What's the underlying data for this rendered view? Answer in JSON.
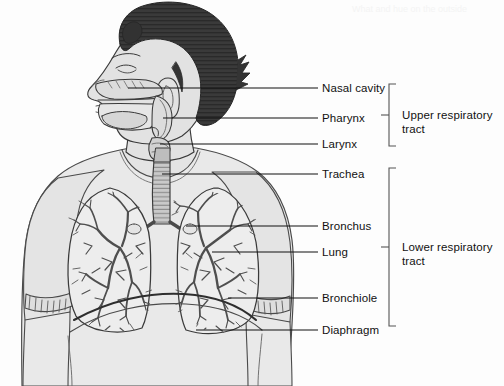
{
  "figure": {
    "background_color": "#fdfdfd",
    "line_color": "#1a1a1a",
    "hair_color": "#3a3a3a",
    "skin_fill": "#e2e2e2",
    "organ_fill": "#ededed",
    "bronchial_tree_color": "#4d4d4d"
  },
  "labels": [
    {
      "id": "nasal-cavity",
      "text": "Nasal cavity",
      "group": "upper"
    },
    {
      "id": "pharynx",
      "text": "Pharynx",
      "group": "upper"
    },
    {
      "id": "larynx",
      "text": "Larynx",
      "group": "upper"
    },
    {
      "id": "trachea",
      "text": "Trachea",
      "group": "lower"
    },
    {
      "id": "bronchus",
      "text": "Bronchus",
      "group": "lower"
    },
    {
      "id": "lung",
      "text": "Lung",
      "group": "lower"
    },
    {
      "id": "bronchiole",
      "text": "Bronchiole",
      "group": "lower"
    },
    {
      "id": "diaphragm",
      "text": "Diaphragm",
      "group": "lower"
    }
  ],
  "groups": [
    {
      "id": "upper",
      "line1": "Upper respiratory",
      "line2": "tract"
    },
    {
      "id": "lower",
      "line1": "Lower respiratory",
      "line2": "tract"
    }
  ],
  "bleed_through": {
    "header": "What and hue on the outside",
    "note": "faint reverse-side text showing through the page"
  }
}
